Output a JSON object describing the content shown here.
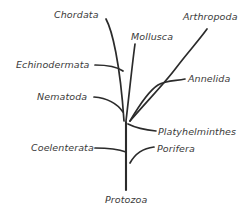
{
  "diagram": {
    "type": "phylogenetic-tree",
    "background_color": "#ffffff",
    "line_color": "#2b2b2b",
    "label_color": "#3a3a3a",
    "root_label": "Protozoa"
  },
  "taxa": [
    {
      "name": "chordata",
      "label": "Chordata",
      "label_x": 54,
      "label_y": 9,
      "anchor": "left"
    },
    {
      "name": "mollusca",
      "label": "Mollusca",
      "label_x": 131,
      "label_y": 31,
      "anchor": "left"
    },
    {
      "name": "arthropoda",
      "label": "Arthropoda",
      "label_x": 183,
      "label_y": 11,
      "anchor": "left"
    },
    {
      "name": "echinodermata",
      "label": "Echinodermata",
      "label_x": 16,
      "label_y": 59,
      "anchor": "left"
    },
    {
      "name": "annelida",
      "label": "Annelida",
      "label_x": 188,
      "label_y": 73,
      "anchor": "left"
    },
    {
      "name": "nematoda",
      "label": "Nematoda",
      "label_x": 37,
      "label_y": 91,
      "anchor": "left"
    },
    {
      "name": "platyhelminthes",
      "label": "Platyhelminthes",
      "label_x": 158,
      "label_y": 126,
      "anchor": "left"
    },
    {
      "name": "porifera",
      "label": "Porifera",
      "label_x": 157,
      "label_y": 143,
      "anchor": "left"
    },
    {
      "name": "coelenterata",
      "label": "Coelenterata",
      "label_x": 31,
      "label_y": 142,
      "anchor": "left"
    },
    {
      "name": "protozoa",
      "label": "Protozoa",
      "label_x": 105,
      "label_y": 194,
      "anchor": "left"
    }
  ],
  "branches": {
    "trunk": "M126,190 L126,122",
    "chordata": "M106,19 C112,30 120,62 124,121",
    "mollusca": "M135,44 C132,66 129,96 126,121",
    "arthropoda": "M207,29 C196,44 188,52 176,68 C164,84 148,100 130,121",
    "annelida": "M185,79 C176,81 166,80 158,85 C150,90 140,104 130,121",
    "echinodermata": "M95,65 C107,65 116,66 123,71",
    "nematoda": "M94,97 C106,98 116,102 123,112",
    "platyhelminthes": "M156,131 C146,130 136,128 128,124",
    "porifera": "M154,147 C145,148 136,152 130,163",
    "coelenterata": "M95,148 C108,148 118,149 126,152"
  }
}
